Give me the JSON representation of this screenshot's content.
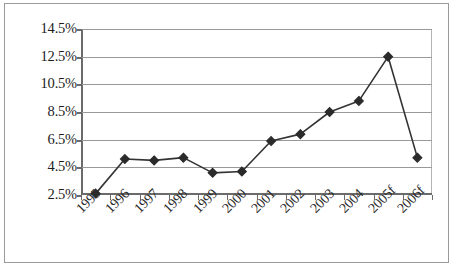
{
  "chart_data": {
    "type": "line",
    "title": "",
    "subtitle": "",
    "xlabel": "",
    "ylabel": "",
    "categories": [
      "1995",
      "1996",
      "1997",
      "1998",
      "1999",
      "2000",
      "2001",
      "2002",
      "2003",
      "2004",
      "2005f",
      "2006f"
    ],
    "values": [
      2.6,
      5.1,
      5.0,
      5.2,
      4.1,
      4.2,
      6.4,
      6.9,
      8.5,
      9.3,
      12.5,
      5.2
    ],
    "series": [
      {
        "name": "",
        "values": [
          2.6,
          5.1,
          5.0,
          5.2,
          4.1,
          4.2,
          6.4,
          6.9,
          8.5,
          9.3,
          12.5,
          5.2
        ]
      }
    ],
    "ylim": [
      2.5,
      14.5
    ],
    "ytick_values": [
      2.5,
      4.5,
      6.5,
      8.5,
      10.5,
      12.5,
      14.5
    ],
    "ytick_labels": [
      "2.5%",
      "4.5%",
      "6.5%",
      "8.5%",
      "10.5%",
      "12.5%",
      "14.5%"
    ],
    "xtick_labels": [
      "1995",
      "1996",
      "1997",
      "1998",
      "1999",
      "2000",
      "2001",
      "2002",
      "2003",
      "2004",
      "2005f",
      "2006f"
    ],
    "grid": true,
    "grid_axis": "y",
    "legend": false,
    "legend_position": "none",
    "marker": "diamond",
    "line_color": "#333333",
    "marker_color": "#2b2b2b",
    "grid_color": "#999999",
    "axis_color": "#6b6b6b",
    "border_color": "#9a9a9a",
    "background": "#ffffff",
    "xlabel_rotation": -45,
    "annotations": []
  },
  "axis": {
    "y_labels": [
      "14.5%",
      "12.5%",
      "10.5%",
      "8.5%",
      "6.5%",
      "4.5%",
      "2.5%"
    ],
    "x_labels": [
      "1995",
      "1996",
      "1997",
      "1998",
      "1999",
      "2000",
      "2001",
      "2002",
      "2003",
      "2004",
      "2005f",
      "2006f"
    ]
  }
}
